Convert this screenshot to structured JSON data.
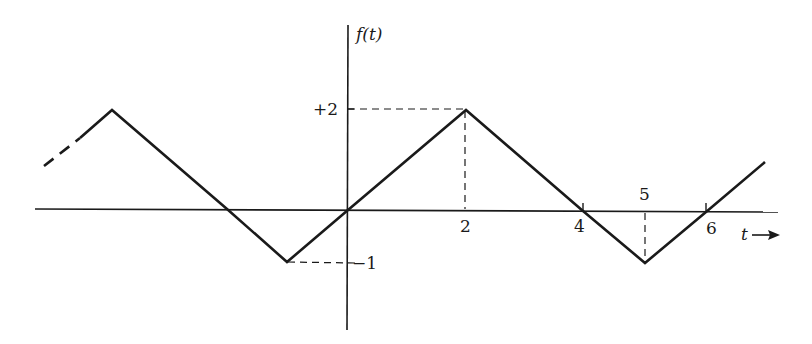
{
  "diagram": {
    "type": "waveform",
    "y_axis_label": "f(t)",
    "x_axis_label": "t",
    "x_axis_arrow": "→",
    "y_ticks": [
      {
        "label": "+2",
        "value": 2
      },
      {
        "label": "−1",
        "value": -1
      }
    ],
    "x_ticks": [
      {
        "label": "2",
        "value": 2
      },
      {
        "label": "4",
        "value": 4
      },
      {
        "label": "5",
        "value": 5
      },
      {
        "label": "6",
        "value": 6
      }
    ],
    "waveform_points": [
      {
        "t": -3,
        "f": 2
      },
      {
        "t": -1,
        "f": -1
      },
      {
        "t": 0,
        "f": 0
      },
      {
        "t": 2,
        "f": 2
      },
      {
        "t": 4,
        "f": 0
      },
      {
        "t": 5,
        "f": -1
      },
      {
        "t": 6,
        "f": 0
      }
    ],
    "colors": {
      "stroke": "#1a1a1a",
      "background": "#ffffff"
    }
  }
}
